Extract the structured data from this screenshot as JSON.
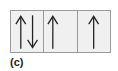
{
  "diagram": {
    "label": "(c)",
    "cells": [
      {
        "arrows": [
          "up",
          "down"
        ]
      },
      {
        "arrows": [
          "up"
        ]
      },
      {
        "arrows": [
          "up"
        ]
      }
    ],
    "colors": {
      "fill": "#f0f0f0",
      "border": "#9a9a9a",
      "arrow": "#222222"
    }
  }
}
